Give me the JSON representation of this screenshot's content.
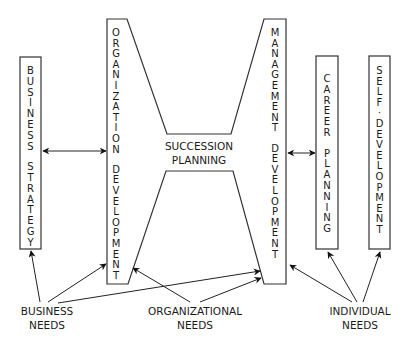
{
  "diagram": {
    "type": "succession-planning-model",
    "boxes": {
      "business_strategy": "BUSINESS STRATEGY",
      "organization_development": "ORGANIZATION DEVELOPMENT",
      "management_development": "MANAGEMENT DEVELOPMENT",
      "career_planning": "CAREER PLANNING",
      "self_development": "SELF-DEVELOPMENT"
    },
    "center": {
      "line1": "SUCCESSION",
      "line2": "PLANNING"
    },
    "needs": {
      "business": {
        "line1": "BUSINESS",
        "line2": "NEEDS"
      },
      "organizational": {
        "line1": "ORGANIZATIONAL",
        "line2": "NEEDS"
      },
      "individual": {
        "line1": "INDIVIDUAL",
        "line2": "NEEDS"
      }
    },
    "connections": [
      {
        "from": "business_strategy",
        "to": "organization_development",
        "type": "bidirectional"
      },
      {
        "from": "management_development",
        "to": "career_planning",
        "type": "bidirectional"
      },
      {
        "from": "business_needs",
        "to": "business_strategy",
        "type": "arrow"
      },
      {
        "from": "business_needs",
        "to": "organization_development",
        "type": "arrow"
      },
      {
        "from": "business_needs",
        "to": "management_development",
        "type": "arrow"
      },
      {
        "from": "organizational_needs",
        "to": "organization_development",
        "type": "arrow"
      },
      {
        "from": "organizational_needs",
        "to": "management_development",
        "type": "arrow"
      },
      {
        "from": "individual_needs",
        "to": "management_development",
        "type": "arrow"
      },
      {
        "from": "individual_needs",
        "to": "career_planning",
        "type": "arrow"
      },
      {
        "from": "individual_needs",
        "to": "self_development",
        "type": "arrow"
      }
    ]
  }
}
